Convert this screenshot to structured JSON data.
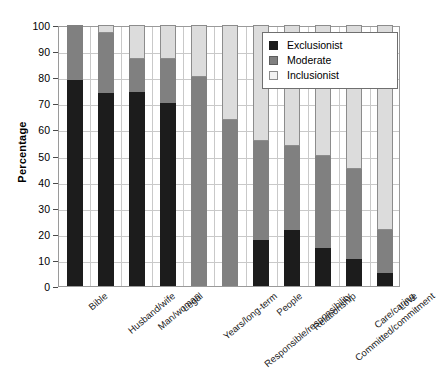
{
  "chart_data": {
    "type": "bar",
    "subtype": "stacked-vertical-100",
    "title": "",
    "xlabel": "",
    "ylabel": "Percentage",
    "ylim": [
      0,
      100
    ],
    "yticks": [
      0,
      10,
      20,
      30,
      40,
      50,
      60,
      70,
      80,
      90,
      100
    ],
    "grid": true,
    "legend_position": "top-right",
    "categories": [
      "Bible",
      "Husband/wife",
      "Man/woman",
      "Legal",
      "Years/long-term",
      "Responsible/responsibility",
      "People",
      "Relationship",
      "Committed/commitment",
      "Care/caring",
      "Love"
    ],
    "series": [
      {
        "name": "Exclusionist",
        "color": "#1c1c1c",
        "values": [
          79,
          74,
          74.5,
          70,
          0,
          0,
          17.5,
          21.5,
          14.5,
          10.5,
          5
        ]
      },
      {
        "name": "Moderate",
        "color": "#808080",
        "values": [
          21,
          23,
          12.5,
          17,
          80,
          63.5,
          38,
          32,
          35.5,
          34.5,
          16.5
        ]
      },
      {
        "name": "Inclusionist",
        "color": "#dcdcdc",
        "values": [
          0,
          3,
          13,
          13,
          20,
          36.5,
          44.5,
          46.5,
          50,
          55,
          78.5
        ]
      }
    ]
  },
  "legend": {
    "items": [
      {
        "label": "Exclusionist",
        "swatch": "exclusionist"
      },
      {
        "label": "Moderate",
        "swatch": "moderate"
      },
      {
        "label": "Inclusionist",
        "swatch": "inclusionist"
      }
    ]
  },
  "axis": {
    "y_title": "Percentage"
  }
}
